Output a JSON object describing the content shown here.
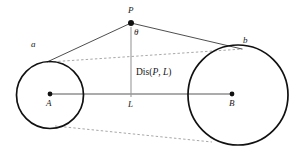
{
  "figure": {
    "background_color": "#ffffff",
    "width": 298,
    "height": 152,
    "stroke_color": "#111111",
    "axis_color": "#8a8a8a",
    "dashed_color": "#9a9a9a",
    "labels": {
      "point_p": "P",
      "theta": "θ",
      "tangent_a": "a",
      "tangent_b": "b",
      "center_a": "A",
      "center_b": "B",
      "foot_l": "L",
      "distance_prefix": "Dis(",
      "distance_p": "P",
      "distance_comma": ", ",
      "distance_l": "L",
      "distance_suffix": ")"
    },
    "geometry": {
      "circle_a": {
        "cx": 50,
        "cy": 95,
        "r": 33.5
      },
      "circle_b": {
        "cx": 238,
        "cy": 95,
        "r": 50
      },
      "point_p": {
        "x": 131,
        "y": 23
      },
      "point_l": {
        "x": 131,
        "y": 95
      },
      "center_dot_a": {
        "x": 50,
        "y": 94
      },
      "center_dot_b": {
        "x": 232,
        "y": 94
      },
      "tangent_point_a": {
        "x": 48,
        "y": 61
      },
      "tangent_point_b": {
        "x": 240,
        "y": 49
      },
      "dashed_upper": {
        "x1": 49,
        "y1": 62,
        "x2": 243,
        "y2": 49
      },
      "dashed_lower": {
        "x1": 55,
        "y1": 126,
        "x2": 212,
        "y2": 142
      },
      "axis_line": {
        "x1": 50,
        "y1": 94,
        "x2": 232,
        "y2": 94
      },
      "vertical_line": {
        "x1": 131,
        "y1": 27,
        "x2": 131,
        "y2": 97
      }
    }
  }
}
